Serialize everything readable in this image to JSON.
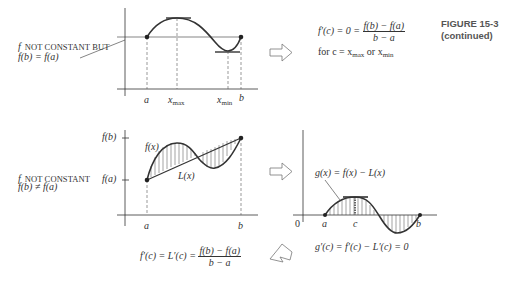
{
  "figure": {
    "title": "FIGURE 15-3",
    "subtitle": "(continued)"
  },
  "panel_top": {
    "caption_line1_f": "f",
    "caption_line1_rest": "NOT CONSTANT BUT",
    "caption_line2": "f(b) = f(a)",
    "x_labels": {
      "a": "a",
      "xmax": "x",
      "xmax_sub": "max",
      "xmin": "x",
      "xmin_sub": "min",
      "b": "b"
    },
    "result_line1_lhs": "f′(c) = 0 =",
    "result_num": "f(b) − f(a)",
    "result_den": "b − a",
    "result_line2_prefix": "for c = x",
    "result_line2_sub1": "max",
    "result_line2_mid": " or x",
    "result_line2_sub2": "min"
  },
  "panel_bottom_left": {
    "caption_line1_f": "f",
    "caption_line1_rest": "NOT CONSTANT",
    "caption_line2": "f(b) ≠ f(a)",
    "y_labels": {
      "fb": "f(b)",
      "fa": "f(a)"
    },
    "curve_labels": {
      "f": "f(x)",
      "L": "L(x)"
    },
    "x_labels": {
      "a": "a",
      "b": "b"
    },
    "result_lhs": "f′(c) = L′(c) =",
    "result_num": "f(b) − f(a)",
    "result_den": "b − a"
  },
  "panel_bottom_right": {
    "curve_label": "g(x) = f(x) − L(x)",
    "x_labels": {
      "origin": "0",
      "a": "a",
      "c": "c",
      "b": "b"
    },
    "result": "g′(c) = f′(c) − L′(c) = 0"
  },
  "arrows": [
    {
      "name": "arrow-right-top",
      "direction": "right"
    },
    {
      "name": "arrow-right-bottom",
      "direction": "right"
    },
    {
      "name": "arrow-down-left",
      "direction": "down-left"
    }
  ],
  "colors": {
    "ink": "#222222",
    "dash": "#555555",
    "arrow": "#777777",
    "figure_label": "#555555"
  }
}
